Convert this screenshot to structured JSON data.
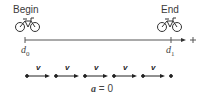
{
  "labels": {
    "begin": "Begin",
    "end": "End",
    "d0": "d",
    "d0_sub": "0",
    "d1": "d",
    "d1_sub": "1",
    "plus": "+",
    "velocity": "v",
    "accel_symbol": "a",
    "accel_eq": " = 0"
  },
  "icons": {
    "bicycle": "bicycle-icon"
  },
  "motion_diagram": {
    "dot_count": 6,
    "arrow_count": 5,
    "velocity_labels": [
      "v",
      "v",
      "v",
      "v",
      "v"
    ]
  }
}
